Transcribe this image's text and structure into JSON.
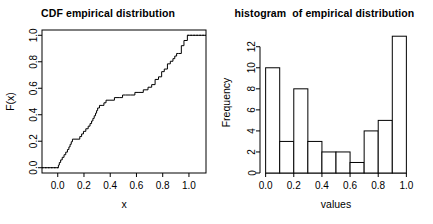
{
  "figure": {
    "background_color": "#ffffff",
    "foreground_color": "#000000",
    "panel_count": 2
  },
  "chart_data": [
    {
      "type": "line",
      "subtype": "ecdf-step",
      "title": "CDF empirical distribution",
      "xlabel": "x",
      "ylabel": "F(x)",
      "xlim": [
        -0.12,
        1.13
      ],
      "ylim": [
        -0.04,
        1.04
      ],
      "xticks": [
        0.0,
        0.2,
        0.4,
        0.6,
        0.8,
        1.0
      ],
      "xtick_labels": [
        "0.0",
        "0.2",
        "0.4",
        "0.6",
        "0.8",
        "1.0"
      ],
      "yticks": [
        0.0,
        0.2,
        0.4,
        0.6,
        0.8,
        1.0
      ],
      "ytick_labels": [
        "0.0",
        "0.2",
        "0.4",
        "0.6",
        "0.8",
        "1.0"
      ],
      "grid": false,
      "legend": null,
      "box_frame": true,
      "line_color": "#000000",
      "line_width": 1,
      "n_points": 51,
      "tail_style": "dotted",
      "x": [
        0.005,
        0.012,
        0.022,
        0.034,
        0.048,
        0.061,
        0.074,
        0.085,
        0.094,
        0.103,
        0.112,
        0.168,
        0.182,
        0.196,
        0.214,
        0.232,
        0.246,
        0.258,
        0.268,
        0.278,
        0.288,
        0.296,
        0.304,
        0.318,
        0.338,
        0.352,
        0.368,
        0.398,
        0.432,
        0.468,
        0.494,
        0.516,
        0.556,
        0.588,
        0.612,
        0.652,
        0.688,
        0.716,
        0.742,
        0.768,
        0.792,
        0.812,
        0.836,
        0.858,
        0.878,
        0.892,
        0.906,
        0.922,
        0.942,
        0.962,
        0.988
      ],
      "y": [
        0.0196,
        0.0392,
        0.0588,
        0.0784,
        0.098,
        0.1176,
        0.1373,
        0.1569,
        0.1765,
        0.1961,
        0.2157,
        0.2353,
        0.2549,
        0.2745,
        0.2941,
        0.3137,
        0.3333,
        0.3529,
        0.3725,
        0.3922,
        0.4118,
        0.4314,
        0.451,
        0.4706,
        0.4706,
        0.4902,
        0.5098,
        0.5098,
        0.5294,
        0.5294,
        0.549,
        0.549,
        0.549,
        0.5686,
        0.5686,
        0.5882,
        0.6078,
        0.6275,
        0.6667,
        0.6863,
        0.7255,
        0.7451,
        0.7843,
        0.8039,
        0.8235,
        0.8431,
        0.8627,
        0.8627,
        0.9216,
        0.9608,
        1.0
      ]
    },
    {
      "type": "bar",
      "subtype": "histogram",
      "title": "histogram  of empirical distribution",
      "xlabel": "values",
      "ylabel": "Frequency",
      "xlim": [
        -0.04,
        1.04
      ],
      "ylim": [
        0,
        13.4
      ],
      "xticks": [
        0.0,
        0.2,
        0.4,
        0.6,
        0.8,
        1.0
      ],
      "xtick_labels": [
        "0.0",
        "0.2",
        "0.4",
        "0.6",
        "0.8",
        "1.0"
      ],
      "yticks": [
        0,
        2,
        4,
        6,
        8,
        10,
        12
      ],
      "ytick_labels": [
        "0",
        "2",
        "4",
        "6",
        "8",
        "10",
        "12"
      ],
      "grid": false,
      "legend": null,
      "box_frame": false,
      "bar_fill": "#ffffff",
      "bar_edge": "#000000",
      "bin_width": 0.1,
      "bin_edges": [
        0.0,
        0.1,
        0.2,
        0.3,
        0.4,
        0.5,
        0.6,
        0.7,
        0.8,
        0.9,
        1.0
      ],
      "categories": [
        "0.0-0.1",
        "0.1-0.2",
        "0.2-0.3",
        "0.3-0.4",
        "0.4-0.5",
        "0.5-0.6",
        "0.6-0.7",
        "0.7-0.8",
        "0.8-0.9",
        "0.9-1.0"
      ],
      "values": [
        10,
        3,
        8,
        3,
        2,
        2,
        1,
        4,
        5,
        13
      ],
      "total_count": 51
    }
  ]
}
